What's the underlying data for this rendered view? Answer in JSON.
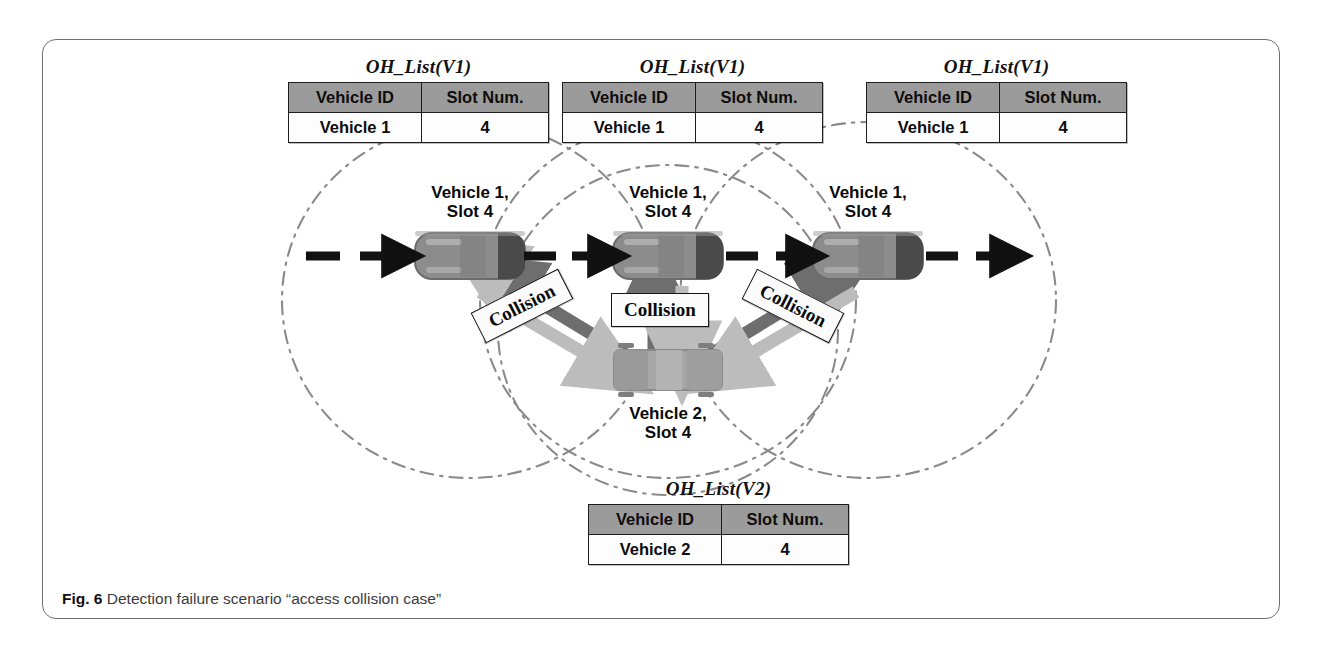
{
  "figure": {
    "caption_label": "Fig. 6",
    "caption_text": "Detection failure scenario “access collision case”",
    "frame_color": "#6f6f73",
    "background": "#ffffff"
  },
  "tables": [
    {
      "id": "oh-list-v1-left",
      "title": "OH_List(V1)",
      "headers": [
        "Vehicle ID",
        "Slot Num."
      ],
      "rows": [
        [
          "Vehicle 1",
          "4"
        ]
      ]
    },
    {
      "id": "oh-list-v1-center",
      "title": "OH_List(V1)",
      "headers": [
        "Vehicle ID",
        "Slot Num."
      ],
      "rows": [
        [
          "Vehicle 1",
          "4"
        ]
      ]
    },
    {
      "id": "oh-list-v1-right",
      "title": "OH_List(V1)",
      "headers": [
        "Vehicle ID",
        "Slot Num."
      ],
      "rows": [
        [
          "Vehicle 1",
          "4"
        ]
      ]
    },
    {
      "id": "oh-list-v2-bottom",
      "title": "OH_List(V2)",
      "headers": [
        "Vehicle ID",
        "Slot Num."
      ],
      "rows": [
        [
          "Vehicle 2",
          "4"
        ]
      ]
    }
  ],
  "vehicle_labels": [
    {
      "id": "vehicle-1-left",
      "text": "Vehicle 1,\nSlot 4"
    },
    {
      "id": "vehicle-1-center",
      "text": "Vehicle 1,\nSlot 4"
    },
    {
      "id": "vehicle-1-right",
      "text": "Vehicle 1,\nSlot 4"
    },
    {
      "id": "vehicle-2-bottom",
      "text": "Vehicle 2,\nSlot 4"
    }
  ],
  "collision_labels": [
    {
      "id": "collision-left",
      "text": "Collision",
      "rotation_deg": -27
    },
    {
      "id": "collision-center",
      "text": "Collision",
      "rotation_deg": 0
    },
    {
      "id": "collision-right",
      "text": "Collision",
      "rotation_deg": 27
    }
  ],
  "colors": {
    "table_header_fill": "#9b9b9b",
    "table_cell_fill": "#fdfdfd",
    "table_border": "#1d1d1d",
    "vehicle_body": "#8c8c8c",
    "vehicle_rear": "#4a4a4a",
    "vehicle_truck": "#a6a6a6",
    "arrow_dark": "#6e6e6e",
    "arrow_light": "#b9b9b9",
    "motion_arrow": "#111111",
    "range_circle": "#8a8a8a"
  },
  "scene": {
    "vehicles": [
      {
        "id": "car-left",
        "type": "car",
        "cx": 470,
        "cy": 256
      },
      {
        "id": "car-center",
        "type": "car",
        "cx": 668,
        "cy": 256
      },
      {
        "id": "car-right",
        "type": "car",
        "cx": 868,
        "cy": 256
      },
      {
        "id": "truck-bottom",
        "type": "truck",
        "cx": 668,
        "cy": 370
      }
    ],
    "range_circles": [
      {
        "id": "range-car-left",
        "cx": 470,
        "cy": 300,
        "r": 185
      },
      {
        "id": "range-car-center",
        "cx": 668,
        "cy": 300,
        "r": 185
      },
      {
        "id": "range-car-right",
        "cx": 868,
        "cy": 300,
        "r": 185
      },
      {
        "id": "range-truck-bottom",
        "cx": 668,
        "cy": 330,
        "r": 165
      }
    ],
    "motion_arrows": [
      {
        "id": "motion-arrow-1",
        "x": 312,
        "y": 256
      },
      {
        "id": "motion-arrow-2",
        "x": 530,
        "y": 256
      },
      {
        "id": "motion-arrow-3",
        "x": 735,
        "y": 256
      },
      {
        "id": "motion-arrow-4",
        "x": 935,
        "y": 256
      }
    ],
    "collision_arrow_pairs": [
      {
        "id": "collision-arrows-left",
        "from": "truck-bottom",
        "to": "car-left"
      },
      {
        "id": "collision-arrows-center",
        "from": "truck-bottom",
        "to": "car-center"
      },
      {
        "id": "collision-arrows-right",
        "from": "truck-bottom",
        "to": "car-right"
      }
    ]
  }
}
